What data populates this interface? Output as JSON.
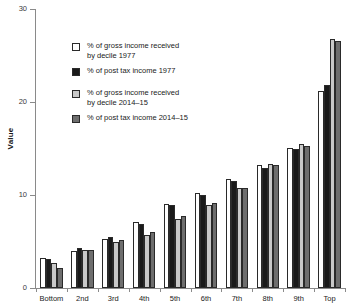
{
  "chart_data": {
    "type": "bar",
    "title": "",
    "xlabel": "",
    "ylabel": "Value",
    "ylim": [
      0,
      30
    ],
    "yticks": [
      0,
      10,
      20,
      30
    ],
    "ytick_labels": [
      "0",
      "10",
      "20",
      "30"
    ],
    "grid": false,
    "legend_position": "upper-left-inside",
    "categories": [
      "Bottom",
      "2nd",
      "3rd",
      "4th",
      "5th",
      "6th",
      "7th",
      "8th",
      "9th",
      "Top"
    ],
    "series": [
      {
        "name": "% of gross income received\nby decile 1977",
        "color": "#ffffff",
        "values": [
          3.2,
          4.0,
          5.3,
          7.1,
          9.0,
          10.2,
          11.7,
          13.2,
          15.1,
          21.2
        ]
      },
      {
        "name": "% of post tax income 1977",
        "color": "#1a1a1a",
        "values": [
          3.1,
          4.3,
          5.5,
          6.9,
          8.9,
          10.0,
          11.5,
          12.9,
          15.0,
          21.8
        ]
      },
      {
        "name": "% of gross income received\nby decile 2014–15",
        "color": "#c9c9c9",
        "values": [
          2.7,
          4.1,
          5.0,
          5.7,
          7.4,
          8.9,
          10.8,
          13.3,
          15.5,
          26.8
        ]
      },
      {
        "name": "% of post tax income 2014–15",
        "color": "#6e6e6e",
        "values": [
          2.2,
          4.1,
          5.2,
          6.0,
          7.7,
          9.1,
          10.8,
          13.2,
          15.3,
          26.6
        ]
      }
    ]
  },
  "legend": {
    "items": [
      {
        "label": "% of gross income received\nby decile 1977",
        "swatch": "white-square-icon"
      },
      {
        "label": "% of post tax income 1977",
        "swatch": "black-square-icon"
      },
      {
        "label": "% of gross income received\nby decile 2014–15",
        "swatch": "light-gray-square-icon"
      },
      {
        "label": "% of post tax income 2014–15",
        "swatch": "dark-gray-square-icon"
      }
    ]
  },
  "axes": {
    "y_title": "Value",
    "y_tick_labels": [
      "30",
      "20",
      "10",
      "0"
    ],
    "x_tick_labels": [
      "Bottom",
      "2nd",
      "3rd",
      "4th",
      "5th",
      "6th",
      "7th",
      "8th",
      "9th",
      "Top"
    ]
  }
}
